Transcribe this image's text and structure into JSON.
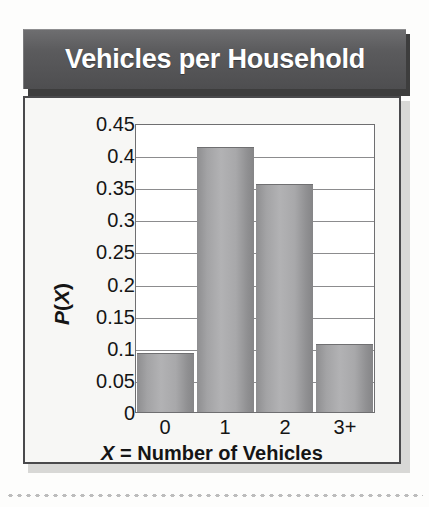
{
  "figure": {
    "title": "Vehicles per Household",
    "title_bg_color": "#58585a",
    "title_text_color": "#ffffff",
    "body_bg_color": "#f7f7f5",
    "border_color": "#4a4a4c",
    "bar_color": "#a8a8aa",
    "gridline_color": "#8c8c8e"
  },
  "chart_data": {
    "type": "bar",
    "title": "Vehicles per Household",
    "categories": [
      "0",
      "1",
      "2",
      "3+"
    ],
    "values": [
      0.093,
      0.416,
      0.357,
      0.107
    ],
    "xlabel_parts": {
      "variable": "X",
      "rest": " = Number of Vehicles"
    },
    "xlabel": "X = Number of Vehicles",
    "ylabel_parts": {
      "p": "P",
      "open": "(",
      "x": "X",
      "close": ")"
    },
    "ylabel": "P(X)",
    "ylim": [
      0,
      0.45
    ],
    "ytick_labels": [
      "0.45",
      "0.4",
      "0.35",
      "0.3",
      "0.25",
      "0.2",
      "0.15",
      "0.1",
      "0.05",
      "0"
    ],
    "ytick_values": [
      0.45,
      0.4,
      0.35,
      0.3,
      0.25,
      0.2,
      0.15,
      0.1,
      0.05,
      0
    ],
    "ystep": 0.05,
    "grid": true,
    "grid_axis": "y",
    "legend": false
  }
}
